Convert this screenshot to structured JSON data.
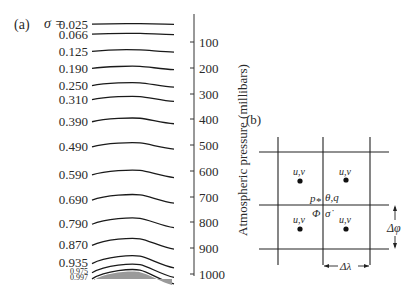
{
  "panel_a": {
    "label": "(a)",
    "sigma_symbol": "σ =",
    "sigma_levels": [
      {
        "value": "0.025",
        "y": 24,
        "amp": 0.5,
        "size": 13
      },
      {
        "value": "0.066",
        "y": 34,
        "amp": 1.0,
        "size": 13
      },
      {
        "value": "0.125",
        "y": 51,
        "amp": 2.0,
        "size": 13
      },
      {
        "value": "0.190",
        "y": 68,
        "amp": 3.0,
        "size": 13
      },
      {
        "value": "0.250",
        "y": 85,
        "amp": 4.0,
        "size": 13
      },
      {
        "value": "0.310",
        "y": 99,
        "amp": 4.5,
        "size": 13
      },
      {
        "value": "0.390",
        "y": 121,
        "amp": 5.0,
        "size": 13
      },
      {
        "value": "0.490",
        "y": 146,
        "amp": 5.5,
        "size": 13
      },
      {
        "value": "0.590",
        "y": 174,
        "amp": 6.5,
        "size": 13
      },
      {
        "value": "0.690",
        "y": 199,
        "amp": 7.5,
        "size": 13
      },
      {
        "value": "0.790",
        "y": 223,
        "amp": 8.5,
        "size": 13
      },
      {
        "value": "0.870",
        "y": 244,
        "amp": 9.5,
        "size": 13
      },
      {
        "value": "0.935",
        "y": 262,
        "amp": 10.5,
        "size": 13
      },
      {
        "value": "0.975",
        "y": 271,
        "amp": 11.5,
        "size": 8
      },
      {
        "value": "0.997",
        "y": 277,
        "amp": 12.5,
        "size": 8
      }
    ],
    "axis_title": "Atmospheric pressure (millibars)",
    "pressure_ticks": [
      {
        "label": "100",
        "y": 42
      },
      {
        "label": "200",
        "y": 68
      },
      {
        "label": "300",
        "y": 94
      },
      {
        "label": "400",
        "y": 119
      },
      {
        "label": "500",
        "y": 145
      },
      {
        "label": "600",
        "y": 171
      },
      {
        "label": "700",
        "y": 197
      },
      {
        "label": "800",
        "y": 222
      },
      {
        "label": "900",
        "y": 248
      },
      {
        "label": "1000",
        "y": 274
      }
    ],
    "terrain_fill": "#9a9a9a"
  },
  "panel_b": {
    "label": "(b)",
    "wind_label": "u,v",
    "center_top_label": "p",
    "center_top_sub": "*",
    "center_top_right": "θ,q",
    "center_bottom_left": "Φ",
    "center_bottom_right": "σ̇",
    "delta_lambda": "Δλ",
    "delta_phi": "Δφ"
  }
}
